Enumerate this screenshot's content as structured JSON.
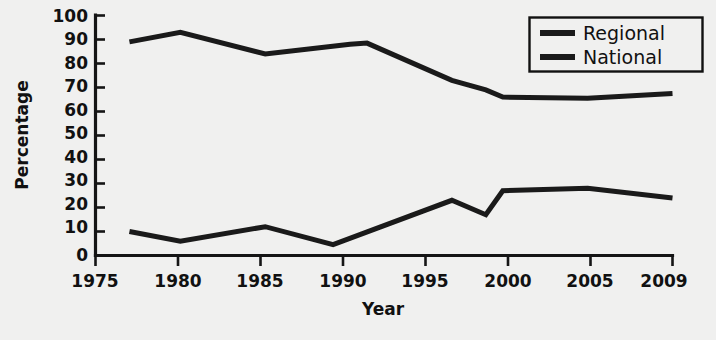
{
  "chart_data": {
    "type": "line",
    "title": "",
    "xlabel": "Year",
    "ylabel": "Percentage",
    "xlim": [
      1975,
      2009
    ],
    "ylim": [
      0,
      100
    ],
    "grid": false,
    "legend_position": "top-right",
    "x_ticks": [
      "1975",
      "1980",
      "1985",
      "1990",
      "1995",
      "2000",
      "2005",
      "2009"
    ],
    "x_tick_values": [
      1975,
      1980,
      1985,
      1990,
      1995,
      2000,
      2005,
      2009
    ],
    "y_ticks": [
      "0",
      "10",
      "20",
      "30",
      "40",
      "50",
      "60",
      "70",
      "80",
      "90",
      "100"
    ],
    "y_tick_values": [
      0,
      10,
      20,
      30,
      40,
      50,
      60,
      70,
      80,
      90,
      100
    ],
    "series": [
      {
        "name": "Regional",
        "color": "#1a1a1a",
        "x": [
          1977,
          1980,
          1985,
          1990,
          1991,
          1996,
          1998,
          1999,
          2004,
          2009
        ],
        "values": [
          89,
          93,
          84,
          88,
          88.5,
          73,
          69,
          66,
          65.5,
          67.5
        ]
      },
      {
        "name": "National",
        "color": "#1a1a1a",
        "x": [
          1977,
          1980,
          1985,
          1989,
          1996,
          1998,
          1999,
          2004,
          2009
        ],
        "values": [
          10,
          6,
          12,
          4.5,
          23,
          17,
          27,
          28,
          24
        ]
      }
    ]
  },
  "legend": {
    "entries": [
      {
        "label": "Regional"
      },
      {
        "label": "National"
      }
    ]
  },
  "axes": {
    "y_title": "Percentage",
    "x_title": "Year"
  },
  "colors": {
    "background": "#f0f0ef",
    "ink": "#1a1a1a",
    "axis": "#151515"
  }
}
